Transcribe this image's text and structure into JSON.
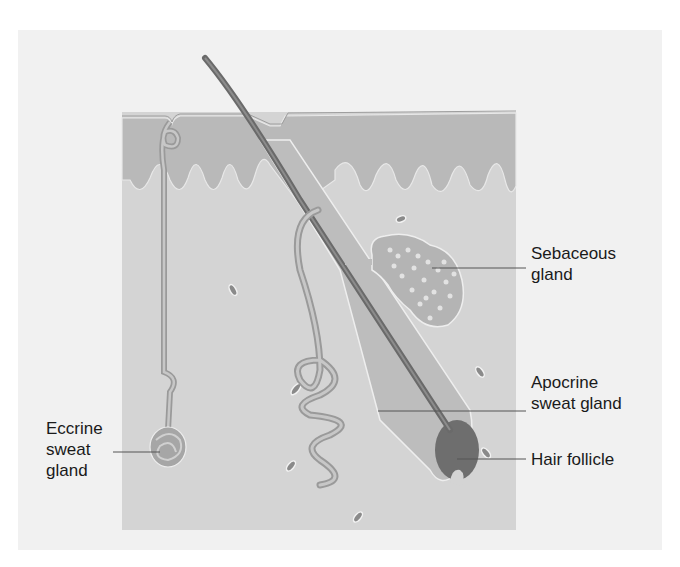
{
  "labels": {
    "sebaceous_gland": "Sebaceous\ngland",
    "apocrine_sweat_gland": "Apocrine\nsweat gland",
    "hair_follicle": "Hair follicle",
    "eccrine_sweat_gland": "Eccrine\nsweat\ngland"
  },
  "colors": {
    "background": "#f1f1f1",
    "epidermis": "#b9b9b9",
    "dermis": "#d4d4d4",
    "hair": "#7a7a7a",
    "gland": "#a8a8a8",
    "leader_line": "#555555",
    "text": "#1a1a1a"
  }
}
